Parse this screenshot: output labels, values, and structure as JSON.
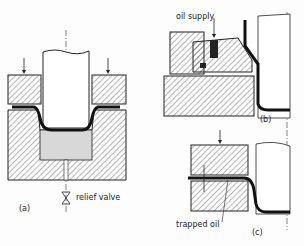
{
  "diagram": {
    "panels": [
      {
        "id": "a",
        "label": "(a)",
        "annotations": [
          "relief valve"
        ]
      },
      {
        "id": "b",
        "label": "(b)",
        "annotations": [
          "oil supply"
        ]
      },
      {
        "id": "c",
        "label": "(c)",
        "annotations": [
          "trapped oil"
        ]
      }
    ]
  },
  "labels": {
    "relief_valve": "relief valve",
    "panel_a": "(a)",
    "oil_supply": "oil supply",
    "panel_b": "(b)",
    "trapped_oil": "trapped oil",
    "panel_c": "(c)"
  }
}
